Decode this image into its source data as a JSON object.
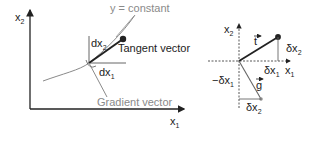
{
  "left_diagram": {
    "y_axis_label": "x",
    "y_axis_sub": "2",
    "x_axis_label": "x",
    "x_axis_sub": "1",
    "curve_label": "y = constant",
    "dx2_label": "dx",
    "dx2_sub": "2",
    "dx1_label": "dx",
    "dx1_sub": "1",
    "tangent_label": "Tangent vector",
    "gradient_label": "Gradient vector"
  },
  "right_diagram": {
    "y_axis_label": "x",
    "y_axis_sub": "2",
    "x_axis_label": "x",
    "x_axis_sub": "1",
    "t_vector_label": "t",
    "g_vector_label": "g",
    "delta_x2_right_label": "δx",
    "delta_x2_right_sub": "2",
    "delta_x1_label": "δx",
    "delta_x1_sub": "1",
    "neg_delta_x1_label": "−δx",
    "neg_delta_x1_sub": "1",
    "delta_x2_bottom_label": "δx",
    "delta_x2_bottom_sub": "2"
  },
  "colors": {
    "ink": "#222222",
    "gray": "#8a8a8a",
    "background": "#ffffff"
  }
}
